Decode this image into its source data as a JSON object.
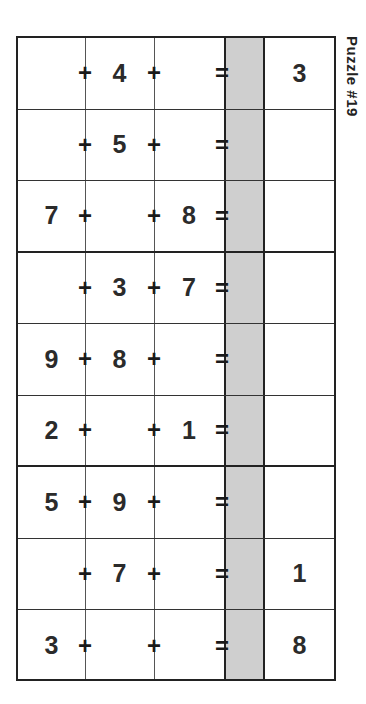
{
  "puzzle": {
    "title": "Puzzle #19",
    "rows": [
      {
        "a": "",
        "b": "4",
        "c": "",
        "answer": "3"
      },
      {
        "a": "",
        "b": "5",
        "c": "",
        "answer": ""
      },
      {
        "a": "7",
        "b": "",
        "c": "8",
        "answer": ""
      },
      {
        "a": "",
        "b": "3",
        "c": "7",
        "answer": ""
      },
      {
        "a": "9",
        "b": "8",
        "c": "",
        "answer": ""
      },
      {
        "a": "2",
        "b": "",
        "c": "1",
        "answer": ""
      },
      {
        "a": "5",
        "b": "9",
        "c": "",
        "answer": ""
      },
      {
        "a": "",
        "b": "7",
        "c": "",
        "answer": "1"
      },
      {
        "a": "3",
        "b": "",
        "c": "",
        "answer": "8"
      }
    ],
    "operators": {
      "plus": "+",
      "equals": "="
    },
    "colors": {
      "shaded_column": "#cfcfcf",
      "lines": "#222222",
      "text": "#2b2b2b"
    }
  }
}
